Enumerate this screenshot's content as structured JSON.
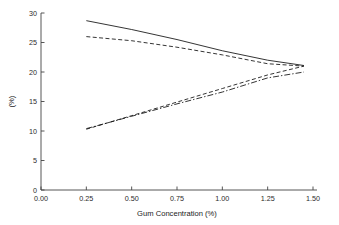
{
  "chart_data": {
    "type": "line",
    "title": "",
    "xlabel": "Gum Concentration (%)",
    "ylabel": "(%)",
    "xlim": [
      0.0,
      1.5
    ],
    "ylim": [
      0,
      30
    ],
    "grid": false,
    "legend": "none",
    "xticks": [
      "0.00",
      "0.25",
      "0.50",
      "0.75",
      "1.00",
      "1.25",
      "1.50"
    ],
    "xtick_values": [
      0.0,
      0.25,
      0.5,
      0.75,
      1.0,
      1.25,
      1.5
    ],
    "yticks": [
      "0",
      "5",
      "10",
      "15",
      "20",
      "25",
      "30"
    ],
    "ytick_values": [
      0,
      5,
      10,
      15,
      20,
      25,
      30
    ],
    "series": [
      {
        "name": "upper-solid",
        "style": "solid",
        "dasharray": "",
        "x": [
          0.25,
          0.5,
          0.75,
          1.0,
          1.25,
          1.45
        ],
        "y": [
          28.7,
          27.2,
          25.5,
          23.6,
          22.0,
          21.1
        ]
      },
      {
        "name": "upper-dashed",
        "style": "dashed",
        "dasharray": "4,2.4",
        "x": [
          0.25,
          0.5,
          0.75,
          1.0,
          1.25,
          1.45
        ],
        "y": [
          26.0,
          25.3,
          24.2,
          22.9,
          21.4,
          21.0
        ]
      },
      {
        "name": "lower-dashed",
        "style": "dashed",
        "dasharray": "4,2.4",
        "x": [
          0.25,
          0.5,
          0.75,
          1.0,
          1.25,
          1.45
        ],
        "y": [
          10.3,
          12.6,
          14.9,
          17.2,
          19.5,
          21.0
        ]
      },
      {
        "name": "lower-dash-dot",
        "style": "dash-dot",
        "dasharray": "6,2,1.4,2",
        "x": [
          0.25,
          0.5,
          0.75,
          1.0,
          1.25,
          1.45
        ],
        "y": [
          10.4,
          12.5,
          14.6,
          16.6,
          19.0,
          20.0
        ]
      }
    ],
    "axis_color": "#444444",
    "line_color": "#111111"
  }
}
